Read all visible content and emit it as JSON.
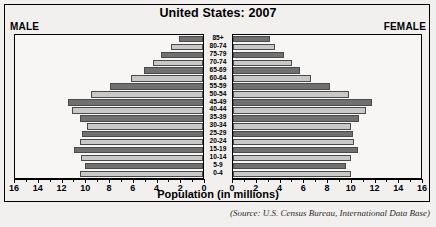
{
  "chart": {
    "title": "United States: 2007",
    "left_label": "MALE",
    "right_label": "FEMALE",
    "xlabel": "Population (in millions)",
    "source": "(Source: U.S. Census Bureau, International Data Base)"
  },
  "colors": {
    "bar_dark": "#707070",
    "bar_light": "#c8c8c8",
    "frame": "#000000",
    "background": "#f2f0ee",
    "plot_background": "#f7f6f4"
  },
  "chart_data": {
    "type": "bar",
    "orientation": "horizontal",
    "subtype": "population-pyramid",
    "title": "United States: 2007",
    "xlabel": "Population (in millions)",
    "ylabel": "",
    "xlim": [
      0,
      16
    ],
    "xticks": [
      0,
      2,
      4,
      6,
      8,
      10,
      12,
      14,
      16
    ],
    "xtick_labels_left": [
      "16",
      "14",
      "12",
      "10",
      "8",
      "6",
      "4",
      "2",
      "0"
    ],
    "xtick_labels_right": [
      "0",
      "2",
      "4",
      "6",
      "8",
      "10",
      "12",
      "14",
      "16"
    ],
    "grid": false,
    "legend": [
      "MALE",
      "FEMALE"
    ],
    "legend_position": "top-corners",
    "categories": [
      "85+",
      "80-74",
      "75-79",
      "70-74",
      "65-69",
      "60-64",
      "55-59",
      "50-54",
      "45-49",
      "40-44",
      "35-39",
      "30-34",
      "25-29",
      "20-24",
      "15-19",
      "10-14",
      "5-9",
      "0-4"
    ],
    "series": [
      {
        "name": "MALE",
        "direction": "left",
        "values": [
          2.0,
          2.7,
          3.5,
          4.2,
          5.0,
          6.1,
          7.8,
          9.4,
          11.4,
          11.0,
          10.4,
          9.8,
          10.2,
          10.4,
          10.9,
          10.3,
          9.9,
          10.4
        ]
      },
      {
        "name": "FEMALE",
        "direction": "right",
        "values": [
          3.1,
          3.5,
          4.3,
          5.0,
          5.6,
          6.6,
          8.2,
          9.8,
          11.7,
          11.2,
          10.6,
          9.9,
          10.1,
          10.2,
          10.5,
          9.9,
          9.5,
          9.9
        ]
      }
    ]
  }
}
